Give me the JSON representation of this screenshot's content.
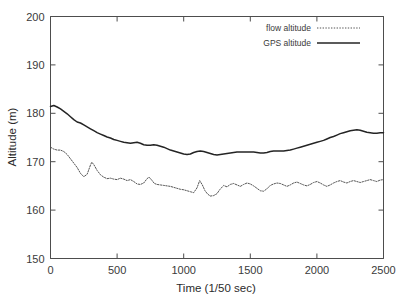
{
  "chart_data": {
    "type": "line",
    "title": "",
    "xlabel": "Time (1/50 sec)",
    "ylabel": "Altitude (m)",
    "xlim": [
      0,
      2500
    ],
    "ylim": [
      150,
      200
    ],
    "xticks": [
      0,
      500,
      1000,
      1500,
      2000,
      2500
    ],
    "yticks": [
      150,
      160,
      170,
      180,
      190,
      200
    ],
    "xtick_labels": [
      "0",
      "500",
      "1000",
      "1500",
      "2000",
      "2500"
    ],
    "ytick_labels": [
      "150",
      "160",
      "170",
      "180",
      "190",
      "200"
    ],
    "grid": false,
    "legend_position": "top-right",
    "series": [
      {
        "name": "flow altitude",
        "style": "dotted",
        "color": "#555555",
        "x": [
          0,
          25,
          50,
          75,
          100,
          125,
          150,
          175,
          200,
          225,
          250,
          275,
          300,
          310,
          325,
          350,
          375,
          400,
          425,
          450,
          475,
          500,
          525,
          550,
          575,
          600,
          625,
          650,
          675,
          700,
          725,
          740,
          760,
          780,
          800,
          825,
          850,
          875,
          900,
          925,
          950,
          975,
          1000,
          1025,
          1050,
          1075,
          1100,
          1120,
          1140,
          1160,
          1180,
          1200,
          1225,
          1250,
          1270,
          1300,
          1325,
          1350,
          1375,
          1400,
          1425,
          1450,
          1475,
          1500,
          1525,
          1550,
          1575,
          1600,
          1625,
          1650,
          1675,
          1700,
          1725,
          1750,
          1775,
          1800,
          1825,
          1850,
          1875,
          1900,
          1925,
          1950,
          1975,
          2000,
          2025,
          2050,
          2075,
          2100,
          2125,
          2150,
          2175,
          2200,
          2225,
          2250,
          2275,
          2300,
          2325,
          2350,
          2375,
          2400,
          2425,
          2450,
          2475,
          2500
        ],
        "y": [
          173.0,
          172.6,
          172.4,
          172.4,
          172.1,
          171.5,
          170.6,
          169.7,
          168.8,
          167.6,
          166.9,
          167.4,
          169.3,
          169.9,
          169.4,
          168.2,
          167.3,
          166.8,
          166.5,
          166.6,
          166.4,
          166.3,
          166.6,
          166.4,
          166.1,
          166.3,
          165.9,
          165.4,
          165.3,
          165.6,
          166.5,
          166.8,
          166.2,
          165.5,
          165.3,
          165.2,
          165.1,
          165.0,
          164.9,
          164.7,
          164.5,
          164.3,
          164.2,
          164.0,
          163.8,
          163.6,
          164.6,
          166.1,
          165.2,
          164.0,
          163.3,
          162.9,
          163.0,
          163.4,
          164.2,
          165.1,
          164.8,
          165.3,
          165.5,
          165.2,
          164.9,
          165.3,
          165.6,
          165.4,
          165.0,
          164.5,
          164.0,
          163.9,
          164.4,
          165.1,
          165.4,
          165.6,
          165.5,
          165.2,
          164.9,
          165.2,
          165.6,
          165.8,
          165.5,
          165.2,
          165.0,
          165.3,
          165.7,
          165.9,
          165.6,
          165.2,
          164.9,
          165.2,
          165.6,
          165.9,
          166.1,
          165.8,
          165.6,
          165.9,
          166.1,
          165.9,
          165.7,
          165.9,
          166.1,
          166.3,
          166.1,
          165.9,
          166.2,
          166.3
        ]
      },
      {
        "name": "GPS altitude",
        "style": "solid",
        "color": "#242424",
        "x": [
          0,
          25,
          50,
          75,
          100,
          125,
          150,
          175,
          200,
          225,
          250,
          275,
          300,
          325,
          350,
          375,
          400,
          425,
          450,
          475,
          500,
          525,
          550,
          575,
          600,
          625,
          650,
          675,
          700,
          725,
          750,
          775,
          800,
          825,
          850,
          875,
          900,
          925,
          950,
          975,
          1000,
          1025,
          1050,
          1075,
          1100,
          1125,
          1150,
          1175,
          1200,
          1225,
          1250,
          1275,
          1300,
          1325,
          1350,
          1375,
          1400,
          1425,
          1450,
          1475,
          1500,
          1525,
          1550,
          1575,
          1600,
          1625,
          1650,
          1675,
          1700,
          1725,
          1750,
          1775,
          1800,
          1825,
          1850,
          1875,
          1900,
          1925,
          1950,
          1975,
          2000,
          2025,
          2050,
          2075,
          2100,
          2125,
          2150,
          2175,
          2200,
          2225,
          2250,
          2275,
          2300,
          2325,
          2350,
          2375,
          2400,
          2425,
          2450,
          2475,
          2500
        ],
        "y": [
          181.4,
          181.6,
          181.3,
          180.9,
          180.4,
          179.9,
          179.3,
          178.7,
          178.2,
          178.0,
          177.6,
          177.2,
          176.8,
          176.4,
          176.0,
          175.7,
          175.4,
          175.1,
          174.9,
          174.6,
          174.4,
          174.2,
          174.0,
          173.9,
          173.8,
          173.9,
          174.0,
          173.8,
          173.5,
          173.4,
          173.4,
          173.5,
          173.4,
          173.2,
          173.0,
          172.7,
          172.4,
          172.2,
          172.0,
          171.8,
          171.6,
          171.5,
          171.6,
          171.9,
          172.1,
          172.2,
          172.1,
          171.9,
          171.7,
          171.5,
          171.4,
          171.5,
          171.6,
          171.7,
          171.8,
          171.9,
          172.0,
          172.0,
          172.0,
          172.0,
          172.0,
          172.0,
          171.9,
          171.8,
          171.8,
          171.9,
          172.1,
          172.2,
          172.2,
          172.2,
          172.2,
          172.3,
          172.4,
          172.6,
          172.8,
          173.0,
          173.2,
          173.4,
          173.6,
          173.8,
          174.0,
          174.2,
          174.4,
          174.7,
          175.0,
          175.2,
          175.5,
          175.8,
          176.0,
          176.2,
          176.4,
          176.5,
          176.6,
          176.5,
          176.3,
          176.1,
          176.0,
          175.9,
          175.9,
          176.0,
          176.0
        ]
      }
    ]
  }
}
